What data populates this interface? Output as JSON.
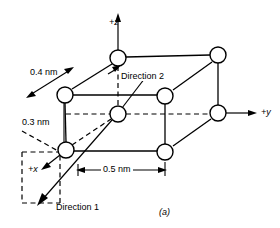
{
  "figure": {
    "caption": "(a)",
    "axes": [
      {
        "name": "z-axis",
        "label": "+z"
      },
      {
        "name": "y-axis",
        "label": "+y"
      },
      {
        "name": "x-axis",
        "label": "+x"
      }
    ],
    "dimensions": [
      {
        "name": "depth",
        "label": "0.4 nm",
        "value": 0.4,
        "unit": "nm"
      },
      {
        "name": "height",
        "label": "0.3 nm",
        "value": 0.3,
        "unit": "nm"
      },
      {
        "name": "width",
        "label": "0.5 nm",
        "value": 0.5,
        "unit": "nm"
      }
    ],
    "annotations": [
      {
        "name": "direction-1",
        "label": "Direction 1"
      },
      {
        "name": "direction-2",
        "label": "Direction 2"
      }
    ],
    "atom_count": 8,
    "colors": {
      "stroke": "#000000",
      "fill": "#ffffff",
      "background": "#ffffff"
    }
  }
}
